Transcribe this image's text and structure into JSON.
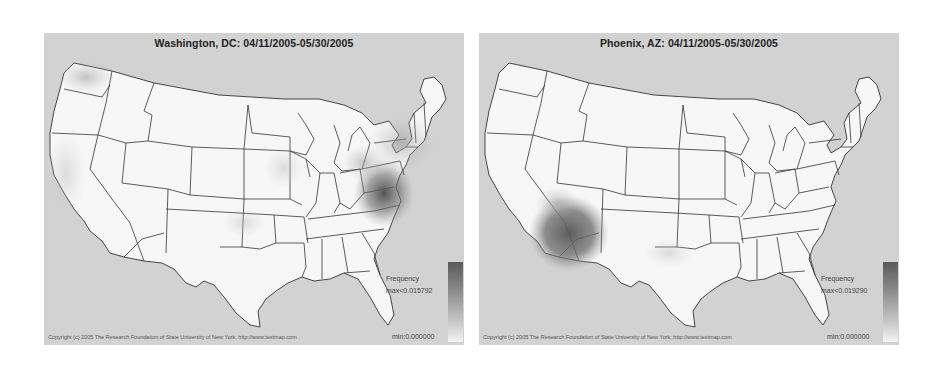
{
  "panels": [
    {
      "title": "Washington, DC: 04/11/2005-05/30/2005",
      "legend": {
        "title": "Frequency",
        "max_label": "max<0.015792",
        "min_label": "min:0.000000"
      },
      "copyright": "Copyright (c) 2005 The Research Foundation of State University of New York, http://www.textmap.com",
      "hotspots": [
        {
          "region": "Virginia / Washington DC area",
          "intensity": "high"
        },
        {
          "region": "Northeast (NY, PA, New England)",
          "intensity": "medium"
        },
        {
          "region": "Washington state",
          "intensity": "medium"
        },
        {
          "region": "Illinois / Iowa",
          "intensity": "low"
        },
        {
          "region": "California",
          "intensity": "low"
        },
        {
          "region": "Oklahoma / Arkansas",
          "intensity": "low"
        }
      ]
    },
    {
      "title": "Phoenix, AZ: 04/11/2005-05/30/2005",
      "legend": {
        "title": "Frequency",
        "max_label": "max<0.019290",
        "min_label": "min:0.000000"
      },
      "copyright": "Copyright (c) 2005 The Research Foundation of State University of New York, http://www.textmap.com",
      "hotspots": [
        {
          "region": "Arizona / western New Mexico",
          "intensity": "high"
        },
        {
          "region": "Southern Nevada / Utah border",
          "intensity": "low"
        },
        {
          "region": "Texas",
          "intensity": "very low"
        }
      ]
    }
  ],
  "colors": {
    "background": "#d2d2d2",
    "land": "#f7f7f7",
    "border": "#333333",
    "heat_max": "#5a5a5a",
    "heat_min": "#f4f4f4"
  }
}
